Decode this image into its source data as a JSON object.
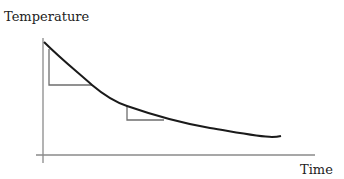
{
  "diagram": {
    "y_axis_label": "Temperature",
    "x_axis_label": "Time",
    "curve": {
      "description": "cooling curve - temperature decreasing over time with decreasing slope",
      "color": "#1a1a1a"
    },
    "tangent_triangles": [
      {
        "position": "early",
        "description": "steep slope triangle"
      },
      {
        "position": "later",
        "description": "shallow slope triangle"
      }
    ],
    "axis_color": "#888888",
    "triangle_color": "#707070"
  }
}
